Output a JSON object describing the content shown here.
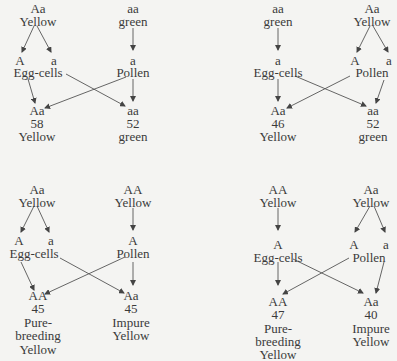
{
  "panels": [
    {
      "id": "cross-1",
      "female_parent": {
        "genotype": "Aa",
        "phenotype": "Yellow"
      },
      "male_parent": {
        "genotype": "aa",
        "phenotype": "green"
      },
      "egg_gametes": [
        "A",
        "a"
      ],
      "egg_label": "Egg-cells",
      "pollen_gametes": [
        "a"
      ],
      "pollen_label": "Pollen",
      "offspring": [
        {
          "genotype": "Aa",
          "count": "58",
          "phenotype": "Yellow"
        },
        {
          "genotype": "aa",
          "count": "52",
          "phenotype": "green"
        }
      ]
    },
    {
      "id": "cross-2",
      "female_parent": {
        "genotype": "aa",
        "phenotype": "green"
      },
      "male_parent": {
        "genotype": "Aa",
        "phenotype": "Yellow"
      },
      "egg_gametes": [
        "a"
      ],
      "egg_label": "Egg-cells",
      "pollen_gametes": [
        "A",
        "a"
      ],
      "pollen_label": "Pollen",
      "offspring": [
        {
          "genotype": "Aa",
          "count": "46",
          "phenotype": "Yellow"
        },
        {
          "genotype": "aa",
          "count": "52",
          "phenotype": "green"
        }
      ]
    },
    {
      "id": "cross-3",
      "female_parent": {
        "genotype": "Aa",
        "phenotype": "Yellow"
      },
      "male_parent": {
        "genotype": "AA",
        "phenotype": "Yellow"
      },
      "egg_gametes": [
        "A",
        "a"
      ],
      "egg_label": "Egg-cells",
      "pollen_gametes": [
        "A"
      ],
      "pollen_label": "Pollen",
      "offspring": [
        {
          "genotype": "AA",
          "count": "45",
          "phenotype_lines": [
            "Pure-",
            "breeding",
            "Yellow"
          ]
        },
        {
          "genotype": "Aa",
          "count": "45",
          "phenotype_lines": [
            "Impure",
            "Yellow"
          ]
        }
      ]
    },
    {
      "id": "cross-4",
      "female_parent": {
        "genotype": "AA",
        "phenotype": "Yellow"
      },
      "male_parent": {
        "genotype": "Aa",
        "phenotype": "Yellow"
      },
      "egg_gametes": [
        "A"
      ],
      "egg_label": "Egg-cells",
      "pollen_gametes": [
        "A",
        "a"
      ],
      "pollen_label": "Pollen",
      "offspring": [
        {
          "genotype": "AA",
          "count": "47",
          "phenotype_lines": [
            "Pure-",
            "breeding",
            "Yellow"
          ]
        },
        {
          "genotype": "Aa",
          "count": "40",
          "phenotype_lines": [
            "Impure",
            "Yellow"
          ]
        }
      ]
    }
  ],
  "colors": {
    "background": "#f4f4f2",
    "ink": "#3a3a3a"
  }
}
